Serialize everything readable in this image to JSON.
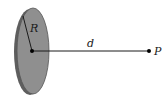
{
  "diagram": {
    "labels": {
      "radius": "R",
      "distance": "d",
      "point": "P"
    },
    "colors": {
      "disk_face": "#8f8f8f",
      "disk_edge": "#5a5a5a",
      "line": "#1a1a1a",
      "background": "#ffffff"
    },
    "geometry": {
      "disk_center": [
        32,
        51
      ],
      "disk_rx": 16,
      "disk_ry": 43,
      "point_p": [
        149,
        51
      ]
    }
  }
}
